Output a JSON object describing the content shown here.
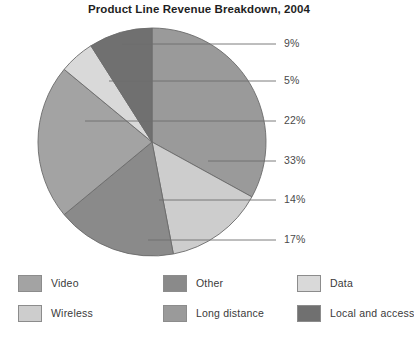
{
  "chart_data": {
    "type": "pie",
    "title": "Product Line Revenue Breakdown, 2004",
    "xlabel": "",
    "ylabel": "",
    "legend_position": "bottom",
    "grid": false,
    "value_suffix": "%",
    "total": 100,
    "categories": [
      "Local and access",
      "Data",
      "Video",
      "Long distance",
      "Wireless",
      "Other"
    ],
    "values": [
      9,
      5,
      22,
      33,
      14,
      17
    ],
    "labels": [
      "9%",
      "5%",
      "22%",
      "33%",
      "14%",
      "17%"
    ],
    "slices": [
      {
        "name": "Long distance",
        "value": 33,
        "label": "33%",
        "color": "#9a9a9a",
        "start_angle": 0,
        "end_angle": 118.8
      },
      {
        "name": "Wireless",
        "value": 14,
        "label": "14%",
        "color": "#cdcdcd",
        "start_angle": 118.8,
        "end_angle": 169.2
      },
      {
        "name": "Other",
        "value": 17,
        "label": "17%",
        "color": "#8a8a8a",
        "start_angle": 169.2,
        "end_angle": 230.4
      },
      {
        "name": "Video",
        "value": 22,
        "label": "22%",
        "color": "#a3a3a3",
        "start_angle": 230.4,
        "end_angle": 309.6
      },
      {
        "name": "Data",
        "value": 5,
        "label": "5%",
        "color": "#d9d9d9",
        "start_angle": 309.6,
        "end_angle": 327.6
      },
      {
        "name": "Local and access",
        "value": 9,
        "label": "9%",
        "color": "#707070",
        "start_angle": 327.6,
        "end_angle": 360
      }
    ],
    "callouts": [
      {
        "label": "9%",
        "slice": "Local and access",
        "y": 24,
        "line_start_x": 122,
        "line_end_x": 276,
        "text_x": 284
      },
      {
        "label": "5%",
        "slice": "Data",
        "y": 61,
        "line_start_x": 109,
        "line_end_x": 276,
        "text_x": 284
      },
      {
        "label": "22%",
        "slice": "Video",
        "y": 101,
        "line_start_x": 85,
        "line_end_x": 276,
        "text_x": 284
      },
      {
        "label": "33%",
        "slice": "Long distance",
        "y": 141,
        "line_start_x": 208,
        "line_end_x": 276,
        "text_x": 284
      },
      {
        "label": "14%",
        "slice": "Wireless",
        "y": 180,
        "line_start_x": 159,
        "line_end_x": 276,
        "text_x": 284
      },
      {
        "label": "17%",
        "slice": "Other",
        "y": 220,
        "line_start_x": 148,
        "line_end_x": 276,
        "text_x": 284
      }
    ]
  },
  "legend": {
    "items": [
      {
        "label": "Video",
        "color": "#a3a3a3"
      },
      {
        "label": "Other",
        "color": "#8a8a8a"
      },
      {
        "label": "Data",
        "color": "#d9d9d9"
      },
      {
        "label": "Wireless",
        "color": "#cdcdcd"
      },
      {
        "label": "Long distance",
        "color": "#9a9a9a"
      },
      {
        "label": "Local and access",
        "color": "#707070"
      }
    ]
  },
  "colors": {
    "background": "#ffffff",
    "title": "#1f1f1f",
    "label_text": "#4a4a4a",
    "leader_line": "#6e6e6e",
    "slice_outline": "#6b6b6b"
  }
}
